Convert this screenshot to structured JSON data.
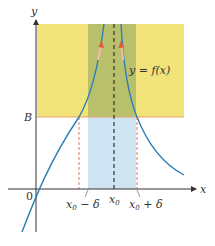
{
  "diagram": {
    "axes": {
      "x_label": "x",
      "y_label": "y",
      "origin_label": "0"
    },
    "horizontal_level": {
      "label": "B"
    },
    "curve": {
      "label_prefix": "y = ",
      "label_func": "f(x)",
      "label": "y = f(x)"
    },
    "ticks": {
      "x0_main": "x",
      "x0_sub": "0",
      "left": {
        "main": "x",
        "sub": "0",
        "suffix": " − δ"
      },
      "right": {
        "main": "x",
        "sub": "0",
        "suffix": " + δ"
      }
    },
    "colors": {
      "yellow_region": "#f2e27a",
      "green_band": "#b5be6a",
      "blue_band": "#cfe4f2",
      "curve": "#2b80b3",
      "level_line": "#e8a36a",
      "red_dashes": "#e07a66",
      "arrows": "#e0593b",
      "axes": "#333333"
    }
  }
}
